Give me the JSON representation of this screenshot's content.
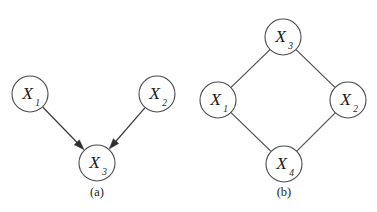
{
  "figure": {
    "background_color": "#ffffff",
    "stroke_color": "#4a4a4f",
    "text_color": "#1d1d20",
    "arrow_color": "#2e2e33",
    "node_radius": 18
  },
  "panels": [
    {
      "id": "panel-a",
      "caption": "(a)",
      "caption_x": 97,
      "caption_y": 196,
      "graph_type": "directed",
      "nodes": [
        {
          "id": "a-x1",
          "var": "X",
          "sub": "1",
          "label": "X1",
          "cx": 30,
          "cy": 94,
          "r": 18
        },
        {
          "id": "a-x2",
          "var": "X",
          "sub": "2",
          "label": "X2",
          "cx": 157,
          "cy": 94,
          "r": 18
        },
        {
          "id": "a-x3",
          "var": "X",
          "sub": "3",
          "label": "X3",
          "cx": 97,
          "cy": 163,
          "r": 18
        }
      ],
      "edges": [
        {
          "id": "a-e1",
          "from": "a-x1",
          "to": "a-x3",
          "directed": true
        },
        {
          "id": "a-e2",
          "from": "a-x2",
          "to": "a-x3",
          "directed": true
        }
      ]
    },
    {
      "id": "panel-b",
      "caption": "(b)",
      "caption_x": 284,
      "caption_y": 196,
      "graph_type": "undirected",
      "nodes": [
        {
          "id": "b-x3",
          "var": "X",
          "sub": "3",
          "label": "X3",
          "cx": 283,
          "cy": 37,
          "r": 18
        },
        {
          "id": "b-x1",
          "var": "X",
          "sub": "1",
          "label": "X1",
          "cx": 218,
          "cy": 100,
          "r": 18
        },
        {
          "id": "b-x2",
          "var": "X",
          "sub": "2",
          "label": "X2",
          "cx": 348,
          "cy": 100,
          "r": 18
        },
        {
          "id": "b-x4",
          "var": "X",
          "sub": "4",
          "label": "X4",
          "cx": 284,
          "cy": 164,
          "r": 18
        }
      ],
      "edges": [
        {
          "id": "b-e1",
          "from": "b-x3",
          "to": "b-x1",
          "directed": false
        },
        {
          "id": "b-e2",
          "from": "b-x3",
          "to": "b-x2",
          "directed": false
        },
        {
          "id": "b-e3",
          "from": "b-x1",
          "to": "b-x4",
          "directed": false
        },
        {
          "id": "b-e4",
          "from": "b-x2",
          "to": "b-x4",
          "directed": false
        }
      ]
    }
  ]
}
